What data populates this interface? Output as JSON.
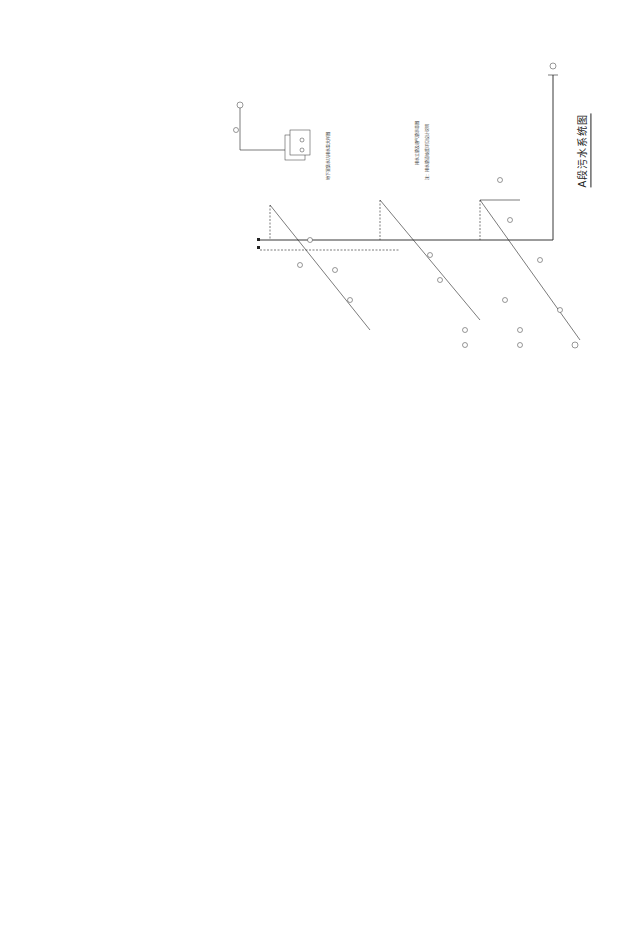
{
  "drawing": {
    "title": "A段污水系统图",
    "orientation": "rotated-90",
    "type": "plumbing-isometric-system-diagram",
    "colors": {
      "background": "#ffffff",
      "line": "#222222"
    }
  },
  "notes": {
    "detail_caption": "地下室集水坑排水泵大样图",
    "legend_title": "管道图例",
    "legend_note_1": "排水立管及通气管示意图",
    "legend_note_2": "注：排水管道坡度详见设计说明"
  },
  "labels": {
    "riser_prefix": "WL-",
    "outlet": "排出管",
    "pump": "潜污泵"
  },
  "systems": [
    {
      "id": "upper-right-main",
      "region": "top-right"
    },
    {
      "id": "pump-pit-detail",
      "region": "top-center"
    },
    {
      "id": "legend-block",
      "region": "top-center-right"
    },
    {
      "id": "middle-horizontal",
      "region": "center"
    },
    {
      "id": "upper-left-branches",
      "region": "top-left"
    },
    {
      "id": "left-branches",
      "region": "left"
    },
    {
      "id": "lower-left-small",
      "region": "bottom-left"
    },
    {
      "id": "lower-center-main",
      "region": "bottom-center"
    },
    {
      "id": "lower-right-main",
      "region": "bottom-right"
    }
  ]
}
